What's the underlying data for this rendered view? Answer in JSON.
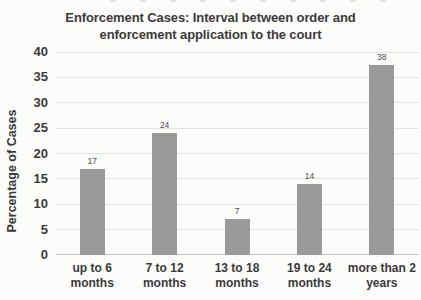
{
  "chart_data": {
    "type": "bar",
    "title": "Enforcement Cases: Interval between order and enforcement application to the court",
    "categories": [
      "up to 6 months",
      "7 to 12 months",
      "13 to 18 months",
      "19 to 24 months",
      "more than 2 years"
    ],
    "category_lines": [
      [
        "up to 6",
        "months"
      ],
      [
        "7 to 12",
        "months"
      ],
      [
        "13 to 18",
        "months"
      ],
      [
        "19 to 24",
        "months"
      ],
      [
        "more than 2",
        "years"
      ]
    ],
    "values": [
      17,
      24,
      7,
      14,
      38
    ],
    "data_labels": [
      "17",
      "24",
      "7",
      "14",
      "38"
    ],
    "xlabel": "",
    "ylabel": "Percentage of Cases",
    "ylim": [
      0,
      40
    ],
    "ytick_step": 5,
    "ytick_labels": [
      "0",
      "5",
      "10",
      "15",
      "20",
      "25",
      "30",
      "35",
      "40"
    ],
    "grid": "horizontal",
    "legend": "none",
    "colors": {
      "bar": "#9a9a9a",
      "text": "#3a3a3a",
      "gridline": "#e3e3e1",
      "baseline": "#c3c3c1",
      "background": "#fcfcfb"
    }
  }
}
